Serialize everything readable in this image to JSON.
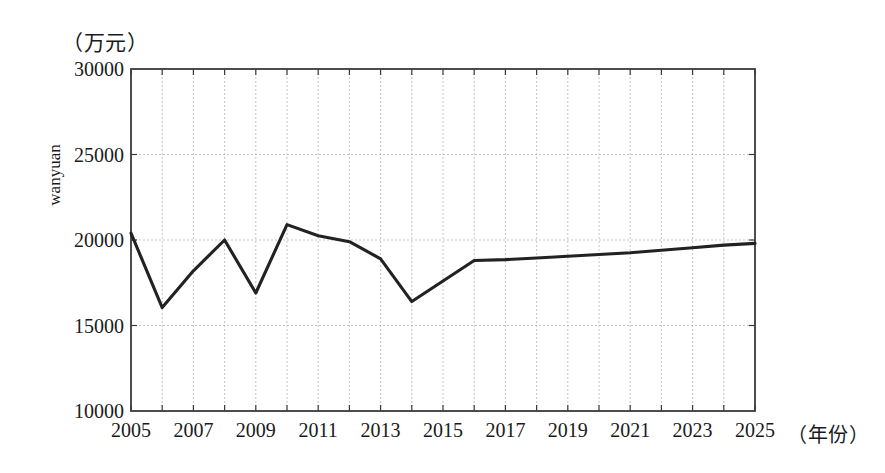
{
  "chart_data": {
    "type": "line",
    "title": "",
    "subtitle": "",
    "xlabel": "（年份）",
    "ylabel": "wanyuan",
    "unit_label": "（万元）",
    "xlim": [
      2005,
      2025
    ],
    "ylim": [
      10000,
      30000
    ],
    "grid": true,
    "legend": null,
    "line_color": "#222222",
    "grid_color": "#b8b8b8",
    "axis_color": "#3a3a3a",
    "y_ticks": [
      10000,
      15000,
      20000,
      25000,
      30000
    ],
    "y_tick_labels": [
      "10000",
      "15000",
      "20000",
      "25000",
      "30000"
    ],
    "x_ticks": [
      2005,
      2007,
      2009,
      2011,
      2013,
      2015,
      2017,
      2019,
      2021,
      2023,
      2025
    ],
    "x_tick_labels": [
      "2005",
      "2007",
      "2009",
      "2011",
      "2013",
      "2015",
      "2017",
      "2019",
      "2021",
      "2023",
      "2025"
    ],
    "x_minor_ticks": [
      2006,
      2008,
      2010,
      2012,
      2014,
      2016,
      2018,
      2020,
      2022,
      2024
    ],
    "x": [
      2005,
      2006,
      2007,
      2008,
      2009,
      2010,
      2011,
      2012,
      2013,
      2014,
      2015,
      2016,
      2017,
      2018,
      2019,
      2020,
      2021,
      2022,
      2023,
      2024,
      2025
    ],
    "values": [
      20400,
      16050,
      18200,
      20000,
      16900,
      20900,
      20250,
      19900,
      18900,
      16400,
      17600,
      18800,
      18850,
      18950,
      19050,
      19150,
      19250,
      19400,
      19550,
      19700,
      19800
    ],
    "series": [
      {
        "name": "wanyuan",
        "values": [
          20400,
          16050,
          18200,
          20000,
          16900,
          20900,
          20250,
          19900,
          18900,
          16400,
          17600,
          18800,
          18850,
          18950,
          19050,
          19150,
          19250,
          19400,
          19550,
          19700,
          19800
        ]
      }
    ]
  }
}
